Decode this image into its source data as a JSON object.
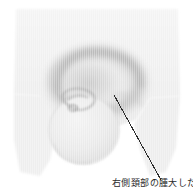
{
  "figure": {
    "type": "anatomical-grayscale-illustration",
    "background_color": "#ffffff",
    "body_fill_color": "#f1f1f1",
    "body_edge_color": "#e4e4e4",
    "shading_color": "#c9c9c9",
    "deep_shading_color": "#b4b4b4",
    "line_color": "#2b2b2b",
    "width": 193,
    "height": 187
  },
  "annotation": {
    "leader_line": {
      "x1": 114,
      "y1": 95,
      "x2": 161,
      "y2": 180,
      "stroke_width": 1,
      "color": "#2b2b2b"
    },
    "caption_text": "右側頚部の腫大した…",
    "caption_clipped": "true"
  },
  "regions": {
    "upper_block_label": "upper-trapezoid-body",
    "lower_left_block_label": "lower-left-body",
    "lower_right_block_label": "lower-right-body",
    "ring_label": "annular-shading-ring",
    "lobe_label": "rounded-lobe",
    "inner_detail_label": "inner-crescent-detail"
  }
}
